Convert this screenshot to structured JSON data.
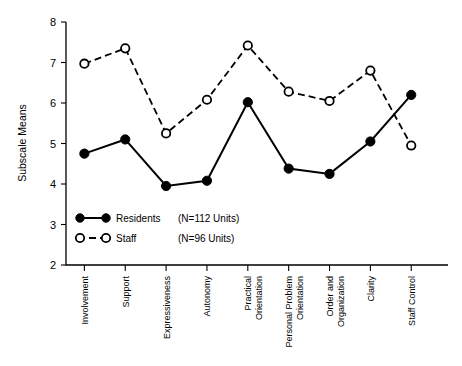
{
  "chart_data": {
    "type": "line",
    "title": "",
    "xlabel": "",
    "ylabel": "Subscale Means",
    "ylim": [
      2,
      8
    ],
    "yticks": [
      2,
      3,
      4,
      5,
      6,
      7,
      8
    ],
    "grid": false,
    "legend_position": "inside-bottom-left",
    "categories": [
      "Involvement",
      "Support",
      "Expressiveness",
      "Autonomy",
      "Practical Orientation",
      "Personal Problem Orientation",
      "Order and Organization",
      "Clarity",
      "Staff Control"
    ],
    "category_lines": [
      [
        "Involvement"
      ],
      [
        "Support"
      ],
      [
        "Expressiveness"
      ],
      [
        "Autonomy"
      ],
      [
        "Practical",
        "Orientation"
      ],
      [
        "Personal Problem",
        "Orientation"
      ],
      [
        "Order and",
        "Organization"
      ],
      [
        "Clarity"
      ],
      [
        "Staff Control"
      ]
    ],
    "series": [
      {
        "name": "Residents",
        "n_label": "(N=112 Units)",
        "marker": "filled-circle",
        "line_style": "solid",
        "color": "#000000",
        "values": [
          4.75,
          5.1,
          3.95,
          4.08,
          6.02,
          4.38,
          4.25,
          5.05,
          6.2
        ]
      },
      {
        "name": "Staff",
        "n_label": "(N=96 Units)",
        "marker": "open-circle",
        "line_style": "dashed",
        "color": "#000000",
        "values": [
          6.97,
          7.35,
          5.25,
          6.08,
          7.42,
          6.28,
          6.05,
          6.8,
          4.95
        ]
      }
    ]
  },
  "axis": {
    "y_title": "Subscale Means",
    "y_tick_labels": [
      "8",
      "7",
      "6",
      "5",
      "4",
      "3",
      "2"
    ]
  },
  "legend": {
    "residents_label": "Residents",
    "residents_n": "(N=112 Units)",
    "staff_label": "Staff",
    "staff_n": "(N=96 Units)"
  }
}
